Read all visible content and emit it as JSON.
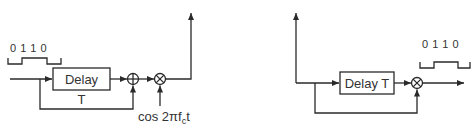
{
  "left_diagram": {
    "input_bits": "0 1 1 0",
    "delay_label": "Delay",
    "delay_param": "T",
    "adder_symbol": "⊕",
    "multiplier_symbol": "⊗",
    "carrier_label": "cos 2πf",
    "carrier_subscript": "c",
    "carrier_suffix": "t"
  },
  "right_diagram": {
    "delay_label": "Delay T",
    "multiplier_symbol": "⊗",
    "output_bits": "0 1 1 0"
  },
  "colors": {
    "line": "#2a2a2a",
    "text": "#333333",
    "background": "#ffffff"
  }
}
